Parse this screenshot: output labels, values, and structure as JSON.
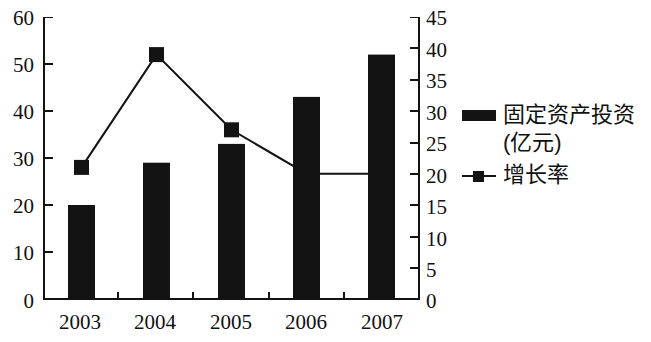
{
  "chart_data": {
    "type": "bar",
    "title": "",
    "subtitle": "",
    "xlabel": "",
    "ylabel": "",
    "grid": false,
    "legend_position": "right",
    "categories": [
      "2003",
      "2004",
      "2005",
      "2006",
      "2007"
    ],
    "axes": {
      "left": {
        "label": "",
        "ylim": [
          0,
          60
        ],
        "ticks": [
          0,
          10,
          20,
          30,
          40,
          50,
          60
        ],
        "tick_labels": [
          "0",
          "10",
          "20",
          "30",
          "40",
          "50",
          "60"
        ]
      },
      "right": {
        "label": "",
        "ylim": [
          0,
          45
        ],
        "ticks": [
          0,
          5,
          10,
          15,
          20,
          25,
          30,
          35,
          40,
          45
        ],
        "tick_labels": [
          "0",
          "5",
          "10",
          "15",
          "20",
          "25",
          "30",
          "35",
          "40",
          "45"
        ]
      }
    },
    "series": [
      {
        "name": "固定资产投资(亿元)",
        "type": "bar",
        "axis": "left",
        "values": [
          20,
          29,
          33,
          43,
          52
        ],
        "color": "#131313"
      },
      {
        "name": "增长率",
        "type": "line",
        "axis": "right",
        "values": [
          21,
          39,
          27,
          20,
          20
        ],
        "color": "#131313",
        "marker": "square"
      }
    ]
  },
  "legend": {
    "items": [
      {
        "label": "固定资产投资\n(亿元)",
        "marker": "bar-swatch"
      },
      {
        "label": "增长率",
        "marker": "line-square-marker"
      }
    ]
  }
}
